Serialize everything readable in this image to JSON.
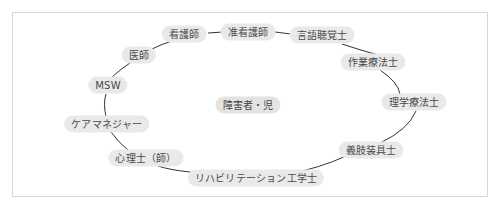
{
  "diagram": {
    "center": {
      "label": "障害者・児",
      "x": 248,
      "y": 105
    },
    "nodes": [
      {
        "id": "kangoshi",
        "label": "看護師",
        "x": 184,
        "y": 34
      },
      {
        "id": "junkangoshi",
        "label": "准看護師",
        "x": 248,
        "y": 32
      },
      {
        "id": "gengochokakushi",
        "label": "言語聴覚士",
        "x": 322,
        "y": 35
      },
      {
        "id": "sagyoryohoshi",
        "label": "作業療法士",
        "x": 373,
        "y": 62
      },
      {
        "id": "rigakuryohoshi",
        "label": "理学療法士",
        "x": 414,
        "y": 102
      },
      {
        "id": "gishisouguushi",
        "label": "義肢装具士",
        "x": 371,
        "y": 150
      },
      {
        "id": "rehab-kogakushi",
        "label": "リハビリテーション工学士",
        "x": 256,
        "y": 178
      },
      {
        "id": "shinrishi",
        "label": "心理士（師）",
        "x": 146,
        "y": 158
      },
      {
        "id": "caremanager",
        "label": "ケアマネジャー",
        "x": 107,
        "y": 124
      },
      {
        "id": "msw",
        "label": "MSW",
        "x": 108,
        "y": 85
      },
      {
        "id": "ishi",
        "label": "医師",
        "x": 139,
        "y": 55
      }
    ],
    "links": [
      {
        "d": "M208 33 L223 32"
      },
      {
        "d": "M275 32 L291 34"
      },
      {
        "d": "M342 44 Q360 50 378 55"
      },
      {
        "d": "M380 70 Q398 82 400 94"
      },
      {
        "d": "M416 111 Q408 130 380 143"
      },
      {
        "d": "M346 156 Q320 168 288 174"
      },
      {
        "d": "M190 172 Q170 170 158 166"
      },
      {
        "d": "M129 151 Q118 142 111 132"
      },
      {
        "d": "M106 117 Q103 103 106 94"
      },
      {
        "d": "M112 77 Q122 68 130 63"
      },
      {
        "d": "M152 49 Q162 44 172 41"
      }
    ],
    "colors": {
      "node_bg": "#e9e9e9",
      "line": "#333333",
      "text": "#4a4a4a",
      "frame": "#d8d8d8"
    }
  }
}
